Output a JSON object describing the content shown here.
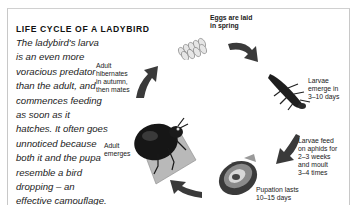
{
  "diagram": {
    "title": "LIFE CYCLE OF A LADYBIRD",
    "intro_text": "The ladybird's larva is an even more voracious predator than the adult, and commences feeding as soon as it hatches. It often goes unnoticed because both it and the pupa resemble a bird dropping – an effective camouflage.",
    "stages": [
      {
        "id": "eggs",
        "label": "Eggs are laid in spring",
        "icon": "egg-cluster-icon"
      },
      {
        "id": "larvae-emerge",
        "label": "Larvae emerge in 3–10 days",
        "icon": "larva-icon"
      },
      {
        "id": "larvae-feed",
        "label": "Larvae feed on aphids for 2–3 weeks and moult 3–4 times"
      },
      {
        "id": "pupation",
        "label": "Pupation lasts 10–15 days",
        "icon": "pupa-icon"
      },
      {
        "id": "adult-emerges",
        "label": "Adult emerges",
        "icon": "adult-ladybird-icon"
      },
      {
        "id": "adult-hibernates",
        "label": "Adult hibernates in autumn, then mates"
      }
    ],
    "labels": {
      "eggs_1": "Eggs are laid",
      "eggs_2": "in spring",
      "emerge_1": "Larvae",
      "emerge_2": "emerge in",
      "emerge_3": "3–10 days",
      "feed_1": "Larvae feed",
      "feed_2": "on aphids for",
      "feed_3": "2–3 weeks",
      "feed_4": "and moult",
      "feed_5": "3–4 times",
      "pupa_1": "Pupation lasts",
      "pupa_2": "10–15 days",
      "adult_1": "Adult",
      "adult_2": "emerges",
      "hib_1": "Adult",
      "hib_2": "hibernates",
      "hib_3": "in autumn,",
      "hib_4": "then mates"
    },
    "colors": {
      "arrow": "#3a3a3a",
      "text": "#1a1a1a",
      "border": "#c8c8c8"
    }
  }
}
